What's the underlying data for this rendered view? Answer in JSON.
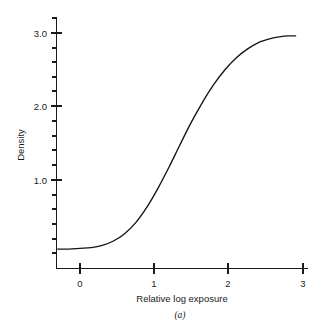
{
  "figure": {
    "caption": "(a)",
    "background_color": "#ffffff",
    "curve_color": "#141414",
    "axis_color": "#1a1a1a"
  },
  "axes": {
    "x": {
      "title": "Relative log exposure",
      "tick_labels": [
        "0",
        "1",
        "2",
        "3"
      ],
      "tick_values": [
        0,
        1,
        2,
        3
      ],
      "range": [
        -0.32,
        3.07
      ],
      "minor_ticks": false
    },
    "y": {
      "title": "Density",
      "tick_labels": [
        "1.0",
        "2.0",
        "3.0"
      ],
      "tick_values": [
        1.0,
        2.0,
        3.0
      ],
      "range": [
        -0.2,
        3.22
      ],
      "minor_tick_interval": 0.2,
      "minor_ticks": true
    }
  },
  "chart_data": {
    "type": "line",
    "title": "",
    "subtitle": "",
    "xlabel": "Relative log exposure",
    "ylabel": "Density",
    "xlim": [
      -0.32,
      3.07
    ],
    "ylim": [
      -0.2,
      3.22
    ],
    "xticks": [
      0,
      1,
      2,
      3
    ],
    "yticks": [
      1.0,
      2.0,
      3.0
    ],
    "yticks_minor_interval": 0.2,
    "grid": false,
    "legend": false,
    "legend_position": "none",
    "annotations": [
      "(a)"
    ],
    "series": [
      {
        "name": "characteristic curve",
        "x": [
          -0.3,
          -0.15,
          0.0,
          0.15,
          0.3,
          0.45,
          0.6,
          0.75,
          0.9,
          1.05,
          1.2,
          1.35,
          1.5,
          1.65,
          1.8,
          1.95,
          2.1,
          2.25,
          2.4,
          2.55,
          2.7,
          2.8,
          2.9
        ],
        "y": [
          0.06,
          0.06,
          0.07,
          0.08,
          0.11,
          0.17,
          0.27,
          0.42,
          0.63,
          0.89,
          1.18,
          1.49,
          1.79,
          2.06,
          2.3,
          2.5,
          2.66,
          2.78,
          2.87,
          2.92,
          2.95,
          2.96,
          2.96
        ]
      }
    ]
  }
}
